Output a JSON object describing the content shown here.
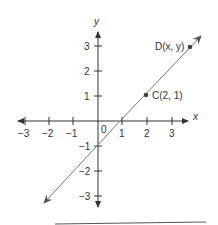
{
  "diagram": {
    "type": "coordinate-plane",
    "axes": {
      "x_label": "x",
      "y_label": "y",
      "origin_label": "0",
      "x_ticks": [
        "−3",
        "−2",
        "−1",
        "1",
        "2",
        "3"
      ],
      "y_ticks": [
        "3",
        "2",
        "1",
        "−1",
        "−2",
        "−3"
      ]
    },
    "line": {
      "equation": "y = x − 1",
      "passes_through": [
        [
          0,
          -1
        ],
        [
          1,
          0
        ],
        [
          2,
          1
        ]
      ]
    },
    "points": [
      {
        "name": "C",
        "label": "C(2, 1)",
        "x": 2,
        "y": 1
      },
      {
        "name": "D",
        "label": "D(x, y)"
      }
    ],
    "colors": {
      "axis": "#333333",
      "line": "#777777",
      "point": "#444444"
    }
  }
}
